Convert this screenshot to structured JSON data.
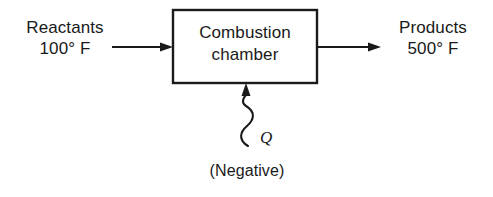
{
  "diagram": {
    "background_color": "#ffffff",
    "line_color": "#1a1a1a",
    "inlet": {
      "stream_name": "Reactants",
      "temperature": "100° F",
      "arrow_direction": "right"
    },
    "process_box": {
      "line_1": "Combustion",
      "line_2": "chamber"
    },
    "outlet": {
      "stream_name": "Products",
      "temperature": "500° F",
      "arrow_direction": "right"
    },
    "heat_transfer": {
      "symbol": "Q",
      "note": "(Negative)",
      "arrow_direction": "up",
      "line_style": "wavy"
    }
  }
}
